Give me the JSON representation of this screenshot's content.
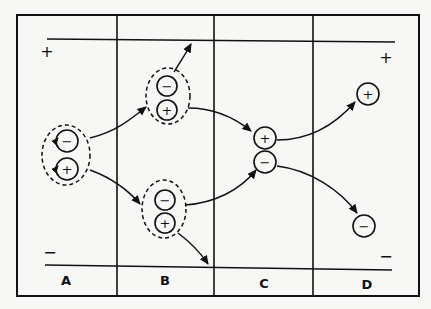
{
  "diagram": {
    "title": "",
    "columns": [
      {
        "id": "A",
        "label": "A"
      },
      {
        "id": "B",
        "label": "B"
      },
      {
        "id": "C",
        "label": "C"
      },
      {
        "id": "D",
        "label": "D"
      }
    ],
    "plates": {
      "top_sign": "+",
      "bottom_sign": "−",
      "top_sign_left": "+",
      "top_sign_right": "+",
      "bottom_sign_left": "−",
      "bottom_sign_right": "−"
    },
    "ions": {
      "A_pair": {
        "neg": "−",
        "pos": "+",
        "grouped": true
      },
      "B_upper_pair": {
        "neg": "−",
        "pos": "+",
        "grouped": true
      },
      "B_lower_pair": {
        "neg": "−",
        "pos": "+",
        "grouped": true
      },
      "C_pos": "+",
      "C_neg": "−",
      "D_pos": "+",
      "D_neg": "−"
    },
    "colors": {
      "ink": "#111111",
      "paper": "#f7f7f5"
    }
  }
}
